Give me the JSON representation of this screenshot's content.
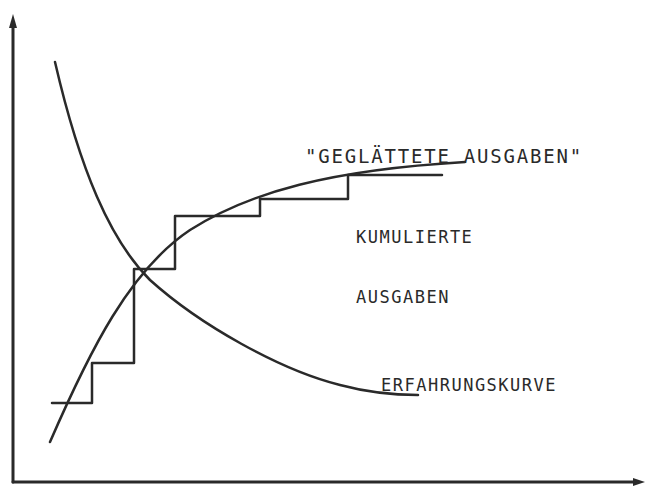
{
  "diagram": {
    "type": "line-diagram",
    "axes": {
      "x_axis": {
        "label": "",
        "arrow": true
      },
      "y_axis": {
        "label": "",
        "arrow": true
      }
    },
    "labels": {
      "smoothed_expenditure": "\"GEGLÄTTETE AUSGABEN\"",
      "cumulative_expenditure_line1": "KUMULIERTE",
      "cumulative_expenditure_line2": "AUSGABEN",
      "experience_curve": "ERFAHRUNGSKURVE"
    },
    "series": [
      {
        "name": "ERFAHRUNGSKURVE",
        "shape": "decreasing convex curve"
      },
      {
        "name": "KUMULIERTE AUSGABEN",
        "shape": "staircase",
        "steps": 6
      },
      {
        "name": "GEGLÄTTETE AUSGABEN",
        "shape": "increasing concave curve"
      }
    ],
    "colors": {
      "ink": "#2a2a2a",
      "background": "#ffffff"
    }
  }
}
